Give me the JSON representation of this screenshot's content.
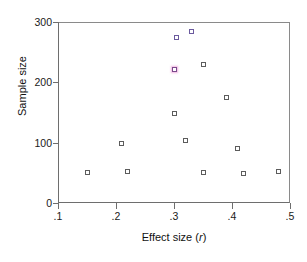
{
  "figure": {
    "frame_color": "#3a3a3a",
    "axis_color": "#6e6e6e",
    "marker_color": "#5c5c5c",
    "highlight_color": "#7a4a8c"
  },
  "chart_data": {
    "type": "scatter",
    "title": "",
    "xlabel_prefix": "Effect size (",
    "xlabel_italic": "r",
    "xlabel_suffix": ")",
    "xlabel": "Effect size (r)",
    "ylabel": "Sample size",
    "xlim": [
      0.1,
      0.5
    ],
    "ylim": [
      0,
      300
    ],
    "xticks": [
      0.1,
      0.2,
      0.3,
      0.4,
      0.5
    ],
    "xticklabels": [
      ".1",
      ".2",
      ".3",
      ".4",
      ".5"
    ],
    "yticks": [
      0,
      100,
      200,
      300
    ],
    "yticklabels": [
      "0",
      "100",
      "200",
      "300"
    ],
    "grid": false,
    "legend": null,
    "marker": "open-square",
    "points": [
      {
        "x": 0.15,
        "y": 50,
        "style": "plain"
      },
      {
        "x": 0.21,
        "y": 98,
        "style": "plain"
      },
      {
        "x": 0.22,
        "y": 52,
        "style": "plain"
      },
      {
        "x": 0.3,
        "y": 148,
        "style": "plain"
      },
      {
        "x": 0.3,
        "y": 222,
        "style": "highlight"
      },
      {
        "x": 0.305,
        "y": 275,
        "style": "tinted"
      },
      {
        "x": 0.32,
        "y": 103,
        "style": "plain"
      },
      {
        "x": 0.33,
        "y": 285,
        "style": "tinted"
      },
      {
        "x": 0.35,
        "y": 50,
        "style": "plain"
      },
      {
        "x": 0.35,
        "y": 229,
        "style": "plain"
      },
      {
        "x": 0.39,
        "y": 175,
        "style": "plain"
      },
      {
        "x": 0.41,
        "y": 90,
        "style": "plain"
      },
      {
        "x": 0.42,
        "y": 49,
        "style": "plain"
      },
      {
        "x": 0.48,
        "y": 52,
        "style": "plain"
      }
    ]
  }
}
